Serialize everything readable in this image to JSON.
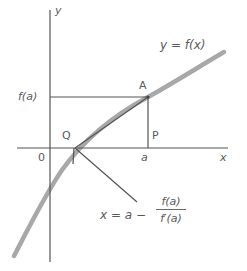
{
  "diagram": {
    "type": "newton-raphson-tangent-construction",
    "axes": {
      "x_label": "x",
      "y_label": "y",
      "origin_label": "0"
    },
    "curve": {
      "label": "y = f(x)",
      "color": "#9a9a9a"
    },
    "points": {
      "A": "A",
      "P": "P",
      "Q": "Q"
    },
    "tick_labels": {
      "x_a": "a",
      "y_fa": "f(a)"
    },
    "formula": {
      "lhs": "x = a −",
      "numerator": "f(a)",
      "denominator": "f′(a)"
    },
    "colors": {
      "line": "#555555",
      "curve": "#a8a8a8",
      "text": "#5a5a5a"
    }
  }
}
